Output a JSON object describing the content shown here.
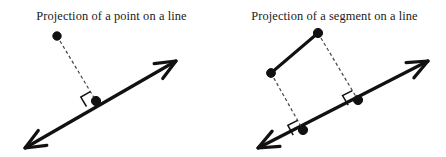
{
  "figure": {
    "name": "projection-diagrams",
    "background_color": "#ffffff",
    "stroke_color": "#111111",
    "dash_color": "#444444",
    "width": 446,
    "height": 157,
    "panel_count": 2
  },
  "panels": [
    {
      "id": "projection-of-a-point",
      "title": "Projection of a point on a line",
      "geometry": {
        "line": {
          "label": "line",
          "from_x": 25,
          "from_y": 148,
          "to_x": 176,
          "to_y": 61,
          "double_arrow": true,
          "stroke_width": 3.2
        },
        "points": [
          {
            "label": "point",
            "x": 57,
            "y": 36,
            "radius": 4.2,
            "filled": true
          },
          {
            "label": "projection-foot",
            "x": 96,
            "y": 101,
            "radius": 4.6,
            "filled": true
          }
        ],
        "dashed_projections": [
          {
            "label": "perpendicular-dropline",
            "from_x": 57,
            "from_y": 36,
            "to_x": 96,
            "to_y": 101
          }
        ],
        "right_angle_marks": [
          {
            "label": "right-angle-at-foot",
            "x": 96,
            "y": 101,
            "size": 11
          }
        ]
      }
    },
    {
      "id": "projection-of-a-segment",
      "title": "Projection of a segment on a line",
      "geometry": {
        "line": {
          "label": "line",
          "from_x": 35,
          "from_y": 148,
          "to_x": 205,
          "to_y": 61,
          "double_arrow": true,
          "stroke_width": 3.2
        },
        "segment": {
          "label": "segment",
          "from_x": 48,
          "from_y": 73,
          "to_x": 95,
          "to_y": 33,
          "stroke_width": 3.0
        },
        "points": [
          {
            "label": "segment-endpoint-left",
            "x": 48,
            "y": 73,
            "radius": 4.4,
            "filled": true
          },
          {
            "label": "segment-endpoint-top",
            "x": 95,
            "y": 33,
            "radius": 4.6,
            "filled": true
          },
          {
            "label": "projection-foot-lower",
            "x": 80,
            "y": 130,
            "radius": 4.6,
            "filled": true
          },
          {
            "label": "projection-foot-upper",
            "x": 135,
            "y": 100,
            "radius": 4.6,
            "filled": true
          }
        ],
        "dashed_projections": [
          {
            "label": "dropline-from-left-endpoint",
            "from_x": 48,
            "from_y": 73,
            "to_x": 80,
            "to_y": 130
          },
          {
            "label": "dropline-from-top-endpoint",
            "from_x": 95,
            "from_y": 33,
            "to_x": 135,
            "to_y": 100
          }
        ],
        "right_angle_marks": [
          {
            "label": "right-angle-at-lower-foot",
            "x": 80,
            "y": 130,
            "size": 11
          },
          {
            "label": "right-angle-at-upper-foot",
            "x": 135,
            "y": 100,
            "size": 11
          }
        ]
      }
    }
  ]
}
